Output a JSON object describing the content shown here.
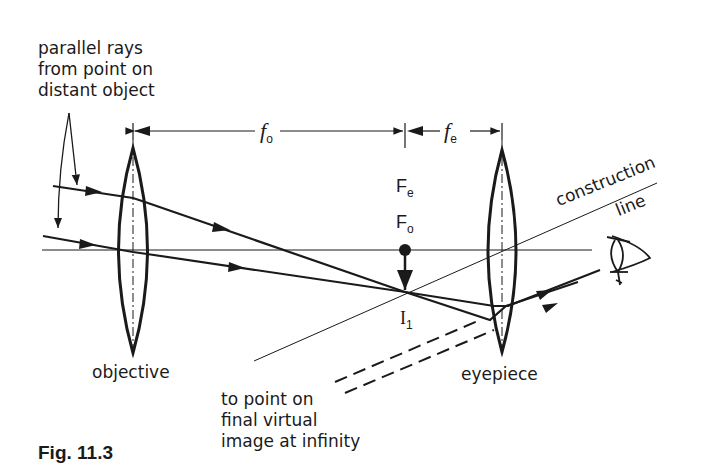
{
  "figure": {
    "caption": "Fig. 11.3",
    "labels": {
      "parallel_rays": [
        "parallel rays",
        "from point on",
        "distant object"
      ],
      "objective": "objective",
      "eyepiece": "eyepiece",
      "virtual_image": [
        "to point on",
        "final virtual",
        "image at infinity"
      ],
      "construction": "construction",
      "line": "line"
    },
    "symbols": {
      "fo_letter": "f",
      "fo_sub": "o",
      "fe_letter": "f",
      "fe_sub": "e",
      "Fe_letter": "F",
      "Fe_sub": "e",
      "Fo_letter": "F",
      "Fo_sub": "o",
      "I1_letter": "I",
      "I1_sub": "1"
    },
    "colors": {
      "ink": "#1a1a1a",
      "background": "#ffffff"
    }
  }
}
